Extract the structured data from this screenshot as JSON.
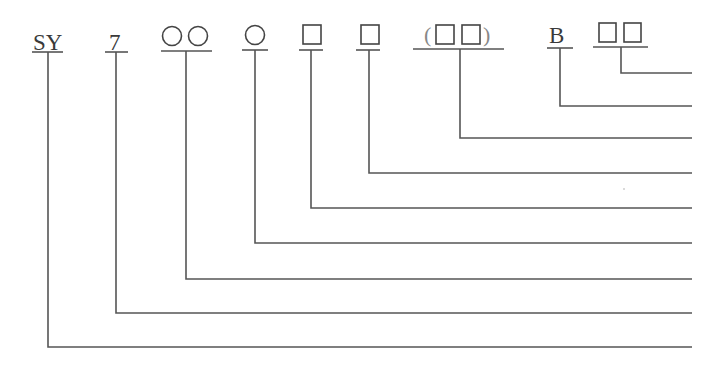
{
  "diagram": {
    "type": "model-code-designation",
    "segments": [
      {
        "id": "seg-sy",
        "text": "SY",
        "kind": "text"
      },
      {
        "id": "seg-7",
        "text": "7",
        "kind": "text"
      },
      {
        "id": "seg-two-circles",
        "text": "○○",
        "kind": "two-circles"
      },
      {
        "id": "seg-circle",
        "text": "○",
        "kind": "circle"
      },
      {
        "id": "seg-square-1",
        "text": "□",
        "kind": "square"
      },
      {
        "id": "seg-square-2",
        "text": "□",
        "kind": "square"
      },
      {
        "id": "seg-paren-squares",
        "text": "(□□)",
        "kind": "paren-two-squares"
      },
      {
        "id": "seg-b",
        "text": "B",
        "kind": "text"
      },
      {
        "id": "seg-two-squares",
        "text": "□□",
        "kind": "two-squares"
      }
    ],
    "labels": {
      "sy": "SY",
      "seven": "7",
      "b": "B",
      "paren_open": "(",
      "paren_close": ")"
    },
    "colors": {
      "line": "#555555",
      "text": "#3a3a3a",
      "background": "#ffffff"
    }
  }
}
